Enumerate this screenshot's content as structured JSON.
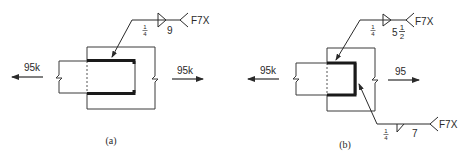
{
  "figure": {
    "panels": [
      {
        "id": "a",
        "caption": "(a)",
        "load_left": "95k",
        "load_right": "95k",
        "weld_symbol": {
          "size": "1/4",
          "size_num": "1",
          "size_den": "4",
          "length": "9",
          "tail": "F7X",
          "side": "arrow-side fillet"
        }
      },
      {
        "id": "b",
        "caption": "(b)",
        "load_left": "95k",
        "load_right": "95",
        "weld_symbol_top": {
          "size": "1/4",
          "size_num": "1",
          "size_den": "4",
          "length": "5 1/2",
          "length_whole": "5",
          "length_num": "1",
          "length_den": "2",
          "tail": "F7X",
          "side": "arrow-side fillet"
        },
        "weld_symbol_bottom": {
          "size": "1/4",
          "size_num": "1",
          "size_den": "4",
          "length": "7",
          "tail": "F7X",
          "side": "arrow-side fillet"
        }
      }
    ],
    "colors": {
      "line": "#3a3a3a",
      "weld": "#1a1a1a",
      "background": "#ffffff"
    }
  }
}
